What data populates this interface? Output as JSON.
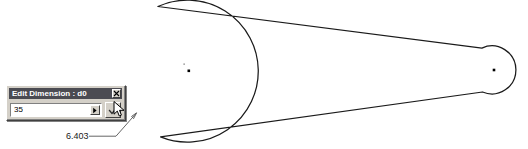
{
  "app": {
    "kind": "cad-sketch-editor",
    "background_color": "#ffffff",
    "line_color": "#1a1a1a"
  },
  "dialog": {
    "title": "Edit Dimension : d0",
    "titlebar_color": "#4b4b52",
    "face_color": "#d4d0c8",
    "value_field": {
      "value": "35",
      "placeholder": "35"
    },
    "dropdown_icon": "chevron-right-icon",
    "accept_icon": "checkmark-icon",
    "close_icon": "close-icon",
    "close_label": "x"
  },
  "annotations": {
    "radius_dimension": {
      "text": "6.403",
      "leader_from": [
        115,
        136
      ],
      "leader_to": [
        137,
        113
      ]
    }
  },
  "sketch": {
    "profile_name": "teardrop-slot-profile",
    "large_arc": {
      "cx": 189,
      "cy": 71,
      "r": 71
    },
    "small_arc": {
      "cx": 494,
      "cy": 70,
      "r": 24
    },
    "center_point_left": {
      "x": 189,
      "y": 71
    },
    "center_point_right": {
      "x": 494,
      "y": 70
    },
    "construction_point": {
      "x": 184,
      "y": 64
    }
  }
}
